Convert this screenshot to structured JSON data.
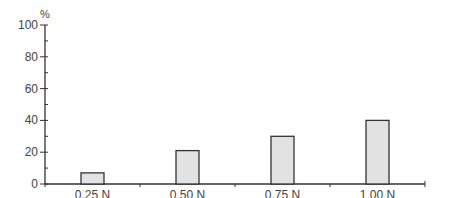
{
  "chart_data": {
    "type": "bar",
    "title": "",
    "xlabel": "",
    "ylabel": "%",
    "categories": [
      "0.25 N",
      "0.50 N",
      "0.75 N",
      "1.00 N"
    ],
    "values": [
      7,
      21,
      30,
      40
    ],
    "ylim": [
      0,
      100
    ],
    "yticks": [
      0,
      20,
      40,
      60,
      80,
      100
    ],
    "y_minor_tick_step": 10,
    "grid": false,
    "legend": null,
    "colors": {
      "bar_fill": "#e2e2e2",
      "bar_stroke": "#333333",
      "axis": "#333333",
      "text": "#444444"
    }
  }
}
